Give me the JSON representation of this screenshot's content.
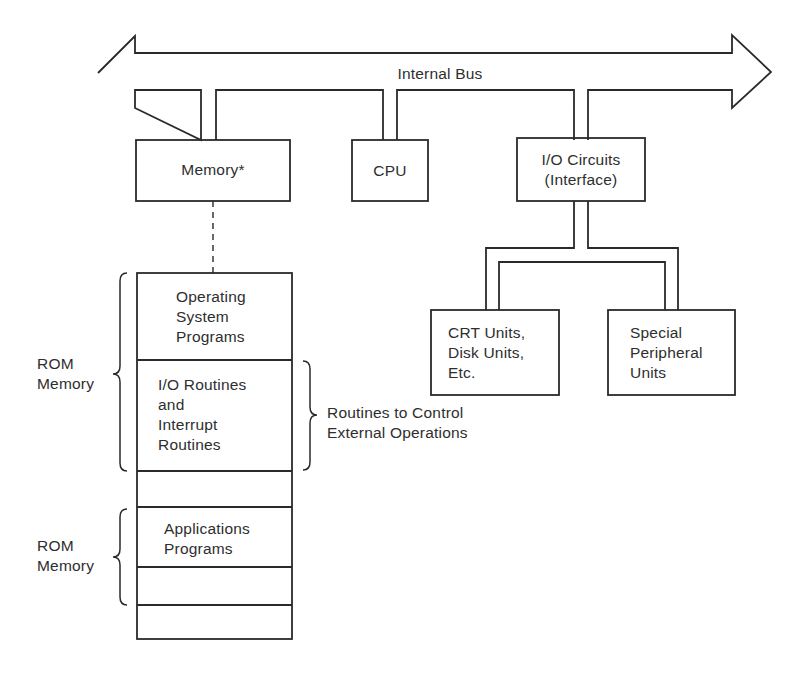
{
  "bus": {
    "label": "Internal Bus"
  },
  "components": {
    "memory": {
      "label": "Memory*"
    },
    "cpu": {
      "label": "CPU"
    },
    "io": {
      "line1": "I/O Circuits",
      "line2": "(Interface)"
    },
    "crt": {
      "line1": "CRT Units,",
      "line2": "Disk Units,",
      "line3": "Etc."
    },
    "special": {
      "line1": "Special",
      "line2": "Peripheral",
      "line3": "Units"
    }
  },
  "memory_map": {
    "segments": [
      {
        "lines": [
          "Operating",
          "System",
          "Programs"
        ]
      },
      {
        "lines": [
          "I/O Routines",
          "and",
          "Interrupt",
          "Routines"
        ]
      },
      {
        "lines": []
      },
      {
        "lines": [
          "Applications",
          "Programs"
        ]
      },
      {
        "lines": []
      },
      {
        "lines": []
      }
    ],
    "left_braces": [
      {
        "line1": "ROM",
        "line2": "Memory"
      },
      {
        "line1": "ROM",
        "line2": "Memory"
      }
    ],
    "right_brace": {
      "line1": "Routines to Control",
      "line2": "External Operations"
    }
  },
  "colors": {
    "line": "#2a2a2a",
    "background": "#ffffff"
  }
}
